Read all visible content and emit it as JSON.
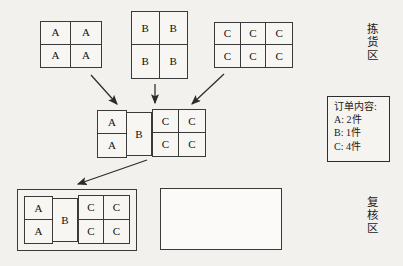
{
  "diagram": {
    "background_color": "#f2f1ee",
    "line_color": "#3a3a3a",
    "zones": {
      "picking": {
        "label_chars": [
          "拣",
          "货",
          "区"
        ],
        "label_text": "拣货区"
      },
      "verification": {
        "label_chars": [
          "复",
          "核",
          "区"
        ],
        "label_text": "复核区"
      }
    },
    "stock_grids": [
      {
        "name": "stock-grid-a",
        "item": "A",
        "cols": 2,
        "rows": 2,
        "cells": [
          "A",
          "A",
          "A",
          "A"
        ]
      },
      {
        "name": "stock-grid-b",
        "item": "B",
        "cols": 2,
        "rows": 2,
        "cells": [
          "B",
          "B",
          "B",
          "B"
        ]
      },
      {
        "name": "stock-grid-c",
        "item": "C",
        "cols": 3,
        "rows": 2,
        "cells": [
          "C",
          "C",
          "C",
          "C",
          "C",
          "C"
        ]
      }
    ],
    "picked_group": {
      "name": "picked-group",
      "a_column": {
        "cols": 1,
        "rows": 2,
        "cells": [
          "A",
          "A"
        ]
      },
      "b_box": {
        "label": "B"
      },
      "c_grid": {
        "cols": 2,
        "rows": 2,
        "cells": [
          "C",
          "C",
          "C",
          "C"
        ]
      }
    },
    "verification_container": {
      "name": "verification-container-filled",
      "a_column": {
        "cols": 1,
        "rows": 2,
        "cells": [
          "A",
          "A"
        ]
      },
      "b_box": {
        "label": "B"
      },
      "c_grid": {
        "cols": 2,
        "rows": 2,
        "cells": [
          "C",
          "C",
          "C",
          "C"
        ]
      }
    },
    "empty_container": {
      "name": "verification-container-empty",
      "label": ""
    },
    "order": {
      "title": "订单内容:",
      "lines": [
        {
          "item": "A:",
          "qty": "2件"
        },
        {
          "item": "B:",
          "qty": "1件"
        },
        {
          "item": "C:",
          "qty": "4件"
        }
      ],
      "line_a": "A: 2件",
      "line_b": "B: 1件",
      "line_c": "C: 4件"
    },
    "arrows": [
      {
        "name": "arrow-a-to-picked",
        "from": "stock-grid-a",
        "to": "picked-group"
      },
      {
        "name": "arrow-b-to-picked",
        "from": "stock-grid-b",
        "to": "picked-group"
      },
      {
        "name": "arrow-c-to-picked",
        "from": "stock-grid-c",
        "to": "picked-group"
      },
      {
        "name": "arrow-picked-to-verification",
        "from": "picked-group",
        "to": "verification-container-filled"
      }
    ]
  }
}
